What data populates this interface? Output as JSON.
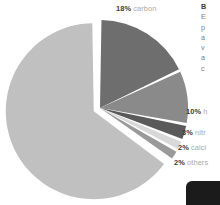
{
  "chart_data": {
    "type": "pie",
    "title": "",
    "legend_position": "callout-labels",
    "grid": false,
    "unit": "%",
    "categories": [
      "oxygen",
      "carbon",
      "hydrogen",
      "nitrogen",
      "calcium",
      "others"
    ],
    "values": [
      65,
      18,
      10,
      3,
      2,
      2
    ],
    "slices": [
      {
        "name": "oxygen",
        "value": 65,
        "value_text": "65%",
        "label_text": "",
        "color": "#c0c0c0",
        "exploded": true,
        "label_visible": false
      },
      {
        "name": "carbon",
        "value": 18,
        "value_text": "18%",
        "label_text": "carbon",
        "color": "#6e6e6e",
        "exploded": false,
        "label_visible": true
      },
      {
        "name": "hydrogen",
        "value": 10,
        "value_text": "10%",
        "label_text": "h",
        "color": "#8a8a8a",
        "exploded": false,
        "label_visible": true
      },
      {
        "name": "nitrogen",
        "value": 3,
        "value_text": "3%",
        "label_text": "nitr",
        "color": "#5a5a5a",
        "exploded": false,
        "label_visible": true
      },
      {
        "name": "calcium",
        "value": 2,
        "value_text": "2%",
        "label_text": "calci",
        "color": "#d8d8d8",
        "exploded": false,
        "label_visible": true
      },
      {
        "name": "others",
        "value": 2,
        "value_text": "2%",
        "label_text": "others",
        "color": "#9a9a9a",
        "exploded": false,
        "label_visible": true
      }
    ],
    "colors": {
      "oxygen": "#c0c0c0",
      "carbon": "#6e6e6e",
      "hydrogen": "#8a8a8a",
      "nitrogen": "#5a5a5a",
      "calcium": "#d8d8d8",
      "others": "#9a9a9a",
      "separator": "#ffffff",
      "value_text": "#3a3a3a",
      "name_text": "#a8a8a8",
      "background": "#ffffff"
    }
  },
  "side_copy": {
    "lines": [
      "B",
      "E",
      "p",
      "a",
      "v",
      "a",
      "c"
    ]
  },
  "corner_block": {
    "label": ""
  }
}
